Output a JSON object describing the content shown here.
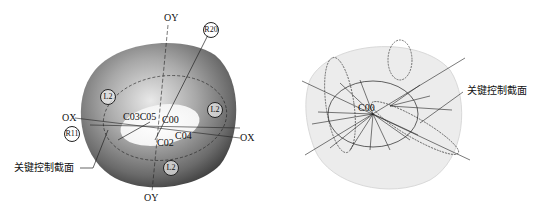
{
  "left_figure": {
    "axes": {
      "oy_top": "OY",
      "oy_bottom": "OY",
      "ox_left": "OX",
      "ox_right": "OX"
    },
    "circled_labels": {
      "r20": "R20",
      "r11": "R11",
      "l2_a": "L2",
      "l2_b": "L2",
      "l2_c": "L2"
    },
    "points": {
      "c03c05": "C03C05",
      "c00": "C00",
      "c04": "C04",
      "c02": "C02"
    },
    "callout": "关键控制截面"
  },
  "right_figure": {
    "points": {
      "c00": "C00"
    },
    "callout": "关键控制截面"
  }
}
